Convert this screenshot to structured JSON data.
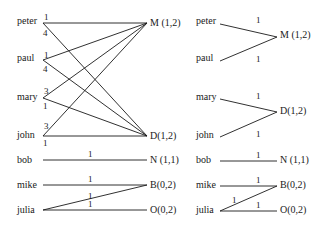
{
  "left_graph": {
    "people": [
      "peter",
      "paul",
      "mary",
      "john",
      "bob",
      "mike",
      "julia"
    ],
    "targets": [
      "M (1,2)",
      "D(1,2)",
      "N (1,1)",
      "B(0,2)",
      "O(0,2)"
    ],
    "edge_weights": {
      "peter_M": "1",
      "peter_D": "4",
      "paul_M": "1",
      "paul_D": "4",
      "mary_M": "3",
      "mary_D": "1",
      "john_M": "3",
      "john_D": "1",
      "bob_N": "1",
      "mike_B": "1",
      "julia_B": "1",
      "julia_O": "1"
    }
  },
  "right_graph": {
    "people": [
      "peter",
      "paul",
      "mary",
      "john",
      "bob",
      "mike",
      "julia"
    ],
    "targets": [
      "M (1,2)",
      "D(1,2)",
      "N (1,1)",
      "B(0,2)",
      "O(0,2)"
    ],
    "edge_weights": {
      "peter_M": "1",
      "paul_M": "1",
      "mary_D": "1",
      "john_D": "1",
      "bob_N": "1",
      "mike_B": "1",
      "julia_B": "1",
      "julia_O": "1"
    }
  }
}
